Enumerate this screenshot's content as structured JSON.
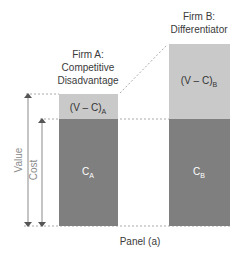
{
  "diagram": {
    "panel_label": "Panel (a)",
    "axis_labels": {
      "value": "Value",
      "cost": "Cost"
    },
    "firms": [
      {
        "id": "A",
        "title_line1": "Firm A:",
        "title_line2": "Competitive",
        "title_line3": "Disadvantage",
        "margin_label": "(V – C)",
        "margin_sub": "A",
        "cost_label": "C",
        "cost_sub": "A"
      },
      {
        "id": "B",
        "title_line1": "Firm B:",
        "title_line2": "Differentiator",
        "title_line3": "",
        "margin_label": "(V – C)",
        "margin_sub": "B",
        "cost_label": "C",
        "cost_sub": "B"
      }
    ],
    "colors": {
      "margin_fill": "#c9c9c9",
      "cost_fill": "#7f7f7f",
      "cost_text": "#ffffff",
      "margin_text": "#333333",
      "dashed_line": "#aaaaaa",
      "arrow": "#8a8a8a"
    }
  }
}
